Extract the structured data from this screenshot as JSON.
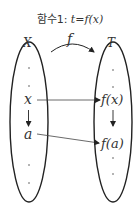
{
  "title": {
    "prefix": "함수1: ",
    "formula": "t=f(x)"
  },
  "sets": {
    "domain_label": "X",
    "codomain_label": "T"
  },
  "mapping_label": "f",
  "elements": {
    "domain": [
      "x",
      "a"
    ],
    "codomain": [
      "f(x)",
      "f(a)"
    ]
  },
  "colors": {
    "stroke": "#222222",
    "text": "#333333"
  }
}
